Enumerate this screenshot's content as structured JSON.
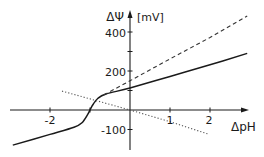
{
  "chart_data": {
    "type": "line",
    "title": "",
    "xlabel": "ΔpH",
    "ylabel": "ΔΨ",
    "ylabel_unit": "[mV]",
    "xlim": [
      -3.0,
      3.0
    ],
    "ylim": [
      -180,
      520
    ],
    "grid": false,
    "legend": "none",
    "x_ticks": [
      {
        "value": -2,
        "label": "-2"
      },
      {
        "value": -1,
        "label": ""
      },
      {
        "value": 1,
        "label": "1"
      },
      {
        "value": 2,
        "label": "2"
      }
    ],
    "y_ticks": [
      {
        "value": 400,
        "label": "400"
      },
      {
        "value": 300,
        "label": ""
      },
      {
        "value": 200,
        "label": "200"
      },
      {
        "value": 100,
        "label": ""
      },
      {
        "value": -100,
        "label": "-100"
      }
    ],
    "series": [
      {
        "name": "solid",
        "style": "solid",
        "color": "#1a1a1a",
        "points": [
          [
            -2.93,
            -180
          ],
          [
            -2.0,
            -125
          ],
          [
            -1.4,
            -88
          ],
          [
            -1.2,
            -65
          ],
          [
            -1.05,
            -20
          ],
          [
            -0.95,
            20
          ],
          [
            -0.8,
            60
          ],
          [
            -0.6,
            82
          ],
          [
            0,
            113
          ],
          [
            1.0,
            172
          ],
          [
            2.0,
            232
          ],
          [
            2.93,
            290
          ]
        ]
      },
      {
        "name": "dashed",
        "style": "dashed",
        "color": "#333333",
        "points": [
          [
            -0.65,
            78
          ],
          [
            0,
            150
          ],
          [
            1.0,
            262
          ],
          [
            2.0,
            372
          ],
          [
            2.93,
            482
          ]
        ]
      },
      {
        "name": "dotted",
        "style": "dotted",
        "color": "#555555",
        "points": [
          [
            -1.7,
            97
          ],
          [
            0,
            0
          ],
          [
            1.0,
            -60
          ],
          [
            1.95,
            -123
          ]
        ]
      }
    ]
  },
  "labels": {
    "y_axis_symbol": "ΔΨ",
    "y_axis_unit": "[mV]",
    "x_axis": "ΔpH",
    "tick_400": "400",
    "tick_200": "200",
    "tick_m100": "-100",
    "tick_m2": "-2",
    "tick_1": "1",
    "tick_2": "2"
  }
}
